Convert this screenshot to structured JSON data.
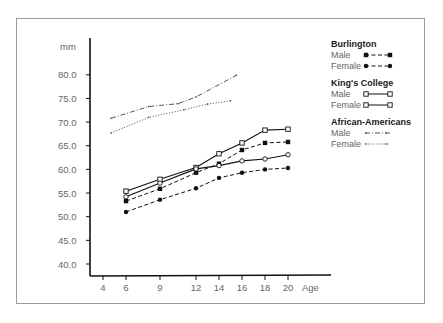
{
  "chart_data": {
    "type": "line",
    "title": "",
    "xlabel": "Age",
    "ylabel": "mm",
    "x_ticks": [
      4,
      6,
      9,
      12,
      14,
      16,
      18,
      20
    ],
    "y_ticks": [
      "40.0",
      "45.0",
      "50.0",
      "55.0",
      "60.0",
      "65.0",
      "70.0",
      "75.0",
      "80.0"
    ],
    "ylim": [
      40,
      82
    ],
    "xlim": [
      3,
      25
    ],
    "grid": false,
    "legend_position": "right",
    "groups": [
      {
        "name": "Burlington",
        "series": [
          {
            "name": "Male",
            "style": "dashed",
            "marker": "filled-square",
            "x": [
              6,
              9,
              12,
              14,
              16,
              18,
              20
            ],
            "values": [
              53.3,
              55.9,
              59.3,
              61.2,
              64.1,
              65.6,
              65.8
            ]
          },
          {
            "name": "Female",
            "style": "dashed",
            "marker": "filled-circle",
            "x": [
              6,
              9,
              12,
              14,
              16,
              18,
              20
            ],
            "values": [
              51.0,
              53.6,
              56.0,
              58.2,
              59.3,
              60.0,
              60.3
            ]
          }
        ]
      },
      {
        "name": "King's College",
        "series": [
          {
            "name": "Male",
            "style": "solid",
            "marker": "open-square",
            "x": [
              6,
              9,
              12,
              14,
              16,
              18,
              20
            ],
            "values": [
              55.4,
              57.9,
              60.4,
              63.3,
              65.6,
              68.3,
              68.5
            ]
          },
          {
            "name": "Female",
            "style": "solid",
            "marker": "open-circle",
            "x": [
              6,
              9,
              12,
              14,
              16,
              18,
              20
            ],
            "values": [
              54.2,
              57.1,
              60.1,
              60.8,
              61.8,
              62.2,
              63.1
            ]
          }
        ]
      },
      {
        "name": "African-Americans",
        "series": [
          {
            "name": "Male",
            "style": "dash-dot",
            "marker": "none",
            "x": [
              4.7,
              8,
              10.5,
              12,
              15.5
            ],
            "values": [
              70.8,
              73.3,
              73.9,
              75.3,
              79.9
            ]
          },
          {
            "name": "Female",
            "style": "dotted",
            "marker": "none",
            "x": [
              4.7,
              8,
              11,
              13,
              15
            ],
            "values": [
              67.7,
              71.0,
              72.6,
              73.8,
              74.5
            ]
          }
        ]
      }
    ]
  },
  "legend": {
    "groups": [
      {
        "title": "Burlington",
        "items": [
          {
            "label": "Male"
          },
          {
            "label": "Female"
          }
        ]
      },
      {
        "title": "King's College",
        "items": [
          {
            "label": "Male"
          },
          {
            "label": "Female"
          }
        ]
      },
      {
        "title": "African-Americans",
        "items": [
          {
            "label": "Male"
          },
          {
            "label": "Female"
          }
        ]
      }
    ]
  },
  "axes": {
    "y_unit": "mm",
    "x_label": "Age"
  }
}
